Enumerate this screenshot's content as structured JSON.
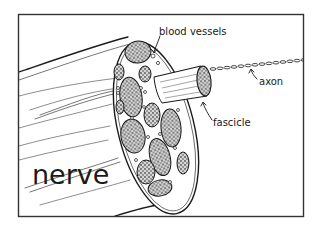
{
  "diagram": {
    "style": "hand-drawn black ink line illustration",
    "colors": {
      "ink": "#1a1a1a",
      "background": "#ffffff",
      "frame": "#333333",
      "fascicle_fill": "#bdbdbd"
    },
    "labels": {
      "blood_vessels": "blood vessels",
      "axon": "axon",
      "fascicle": "fascicle",
      "nerve": "nerve"
    },
    "parts": [
      {
        "id": "nerve",
        "description": "large cylinder bundle extending to the left"
      },
      {
        "id": "cross-section",
        "description": "cut face showing many fascicles and blood vessels"
      },
      {
        "id": "fascicle",
        "description": "single bundle pulled out of the cross-section"
      },
      {
        "id": "axon",
        "description": "chain-like fiber extending from the fascicle"
      },
      {
        "id": "blood-vessels",
        "description": "small round vessels between fascicles"
      }
    ]
  }
}
